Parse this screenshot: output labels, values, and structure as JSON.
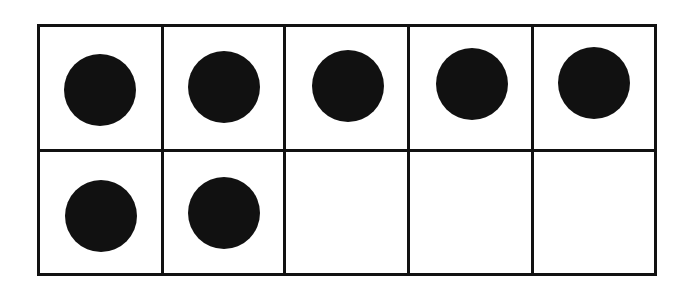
{
  "figure": {
    "kind": "ten-frame",
    "background_color": "#ffffff",
    "line_color": "#111111",
    "counter_color": "#111111",
    "rows": 2,
    "columns": 5,
    "total_cells": 10,
    "filled_count": 7,
    "empty_count": 3
  },
  "grid": {
    "rows": [
      {
        "row_index": 1,
        "row_name": "top-row",
        "cells": [
          {
            "cell_index": 1,
            "filled": true,
            "counter_label": "counter"
          },
          {
            "cell_index": 2,
            "filled": true,
            "counter_label": "counter"
          },
          {
            "cell_index": 3,
            "filled": true,
            "counter_label": "counter"
          },
          {
            "cell_index": 4,
            "filled": true,
            "counter_label": "counter"
          },
          {
            "cell_index": 5,
            "filled": true,
            "counter_label": "counter"
          }
        ]
      },
      {
        "row_index": 2,
        "row_name": "bottom-row",
        "cells": [
          {
            "cell_index": 6,
            "filled": true,
            "counter_label": "counter"
          },
          {
            "cell_index": 7,
            "filled": true,
            "counter_label": "counter"
          },
          {
            "cell_index": 8,
            "filled": false,
            "counter_label": ""
          },
          {
            "cell_index": 9,
            "filled": false,
            "counter_label": ""
          },
          {
            "cell_index": 10,
            "filled": false,
            "counter_label": ""
          }
        ]
      }
    ]
  }
}
